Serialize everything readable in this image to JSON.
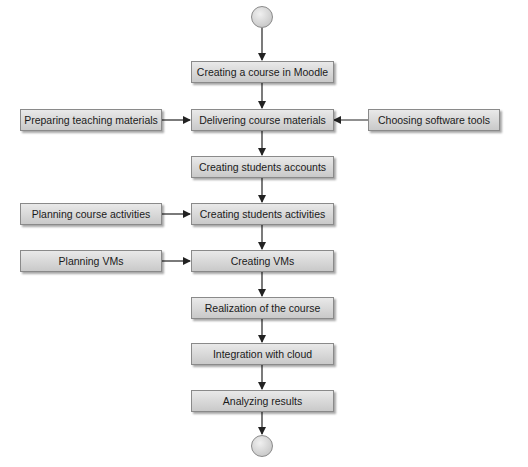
{
  "diagram": {
    "type": "flowchart",
    "start": {
      "label": "start"
    },
    "end": {
      "label": "end"
    },
    "main_steps": [
      {
        "id": "s1",
        "label": "Creating a course in Moodle"
      },
      {
        "id": "s2",
        "label": "Delivering course materials"
      },
      {
        "id": "s3",
        "label": "Creating students accounts"
      },
      {
        "id": "s4",
        "label": "Creating students activities"
      },
      {
        "id": "s5",
        "label": "Creating VMs"
      },
      {
        "id": "s6",
        "label": "Realization of the course"
      },
      {
        "id": "s7",
        "label": "Integration with cloud"
      },
      {
        "id": "s8",
        "label": "Analyzing results"
      }
    ],
    "side_inputs": [
      {
        "id": "p1",
        "label": "Preparing teaching materials",
        "target": "s2",
        "side": "left"
      },
      {
        "id": "p2",
        "label": "Choosing software tools",
        "target": "s2",
        "side": "right"
      },
      {
        "id": "p3",
        "label": "Planning course activities",
        "target": "s4",
        "side": "left"
      },
      {
        "id": "p4",
        "label": "Planning VMs",
        "target": "s5",
        "side": "left"
      }
    ],
    "colors": {
      "box_top": "#e9e9e9",
      "box_bottom": "#c9c9c9",
      "border": "#8a8a8a",
      "line": "#222222"
    }
  }
}
